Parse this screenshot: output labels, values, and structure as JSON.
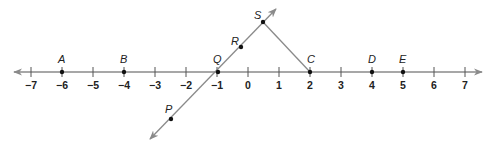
{
  "diagram": {
    "number_line": {
      "min": -7,
      "max": 7,
      "ticks": [
        "−7",
        "−6",
        "−5",
        "−4",
        "−3",
        "−2",
        "−1",
        "0",
        "1",
        "2",
        "3",
        "4",
        "5",
        "6",
        "7"
      ],
      "tick_values": [
        -7,
        -6,
        -5,
        -4,
        -3,
        -2,
        -1,
        0,
        1,
        2,
        3,
        4,
        5,
        6,
        7
      ]
    },
    "points_on_line": [
      {
        "name": "A",
        "value": -6
      },
      {
        "name": "B",
        "value": -4
      },
      {
        "name": "Q",
        "value": -1
      },
      {
        "name": "C",
        "value": 2
      },
      {
        "name": "D",
        "value": 4
      },
      {
        "name": "E",
        "value": 5
      }
    ],
    "points_off_line": [
      {
        "name": "P"
      },
      {
        "name": "R"
      },
      {
        "name": "S"
      }
    ],
    "labels": {
      "A": "A",
      "B": "B",
      "Q": "Q",
      "C": "C",
      "D": "D",
      "E": "E",
      "P": "P",
      "R": "R",
      "S": "S"
    },
    "colors": {
      "line": "#808080",
      "point": "#111111",
      "text": "#222222"
    }
  }
}
